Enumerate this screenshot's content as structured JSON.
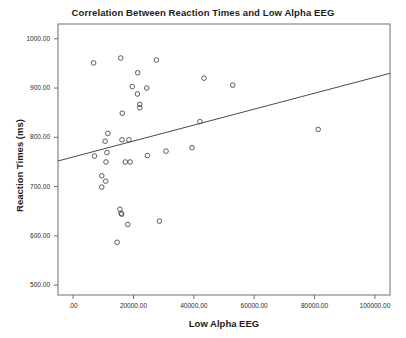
{
  "chart_data": {
    "type": "scatter",
    "title": "Correlation Between Reaction Times and Low Alpha EEG",
    "xlabel": "Low Alpha EEG",
    "ylabel": "Reaction Times (ms)",
    "xlim": [
      -5000,
      105000
    ],
    "ylim": [
      480,
      1030
    ],
    "grid": false,
    "legend": null,
    "xticks": [
      0,
      20000,
      40000,
      60000,
      80000,
      100000
    ],
    "xtick_labels": [
      ".00",
      "20000.00",
      "40000.00",
      "60000.00",
      "80000.00",
      "100000.00"
    ],
    "yticks": [
      500,
      600,
      700,
      800,
      900,
      1000
    ],
    "ytick_labels": [
      "500.00",
      "600.00",
      "700.00",
      "800.00",
      "900.00",
      "1000.00"
    ],
    "marker": "open-circle",
    "marker_color": "#4a4a4a",
    "points": [
      {
        "x": 6800,
        "y": 951
      },
      {
        "x": 15800,
        "y": 961
      },
      {
        "x": 27600,
        "y": 957
      },
      {
        "x": 21400,
        "y": 931
      },
      {
        "x": 43400,
        "y": 920
      },
      {
        "x": 52900,
        "y": 906
      },
      {
        "x": 19600,
        "y": 903
      },
      {
        "x": 24400,
        "y": 900
      },
      {
        "x": 21300,
        "y": 888
      },
      {
        "x": 22100,
        "y": 867
      },
      {
        "x": 22100,
        "y": 860
      },
      {
        "x": 16300,
        "y": 849
      },
      {
        "x": 42000,
        "y": 832
      },
      {
        "x": 81200,
        "y": 816
      },
      {
        "x": 11500,
        "y": 808
      },
      {
        "x": 10600,
        "y": 792
      },
      {
        "x": 16200,
        "y": 795
      },
      {
        "x": 18500,
        "y": 795
      },
      {
        "x": 39400,
        "y": 779
      },
      {
        "x": 30800,
        "y": 772
      },
      {
        "x": 11200,
        "y": 769
      },
      {
        "x": 7100,
        "y": 762
      },
      {
        "x": 24600,
        "y": 763
      },
      {
        "x": 10900,
        "y": 750
      },
      {
        "x": 17300,
        "y": 750
      },
      {
        "x": 18900,
        "y": 750
      },
      {
        "x": 9500,
        "y": 722
      },
      {
        "x": 10800,
        "y": 711
      },
      {
        "x": 9500,
        "y": 699
      },
      {
        "x": 15500,
        "y": 654
      },
      {
        "x": 15900,
        "y": 646
      },
      {
        "x": 16100,
        "y": 644
      },
      {
        "x": 28600,
        "y": 630
      },
      {
        "x": 18100,
        "y": 623
      },
      {
        "x": 14600,
        "y": 587
      }
    ],
    "fit_line": {
      "type": "linear-regression",
      "color": "#4a4a4a",
      "x_start": -5000,
      "y_start": 752,
      "x_end": 105000,
      "y_end": 930
    }
  },
  "axes": {
    "frame_color": "#6e6e6e"
  }
}
